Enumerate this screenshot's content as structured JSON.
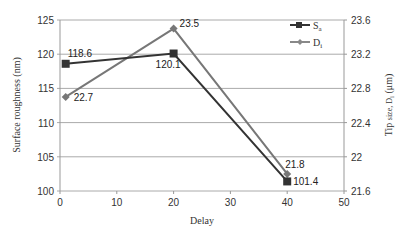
{
  "chart_data": {
    "type": "line",
    "title": "",
    "xlabel": "Delay",
    "ylabel": "Surface roughness (nm)",
    "y2label": "Tip size, D_i (μm)",
    "xlim": [
      0,
      50
    ],
    "ylim": [
      100,
      125
    ],
    "y2lim": [
      21.6,
      23.6
    ],
    "x_ticks": [
      "0",
      "10",
      "20",
      "30",
      "40",
      "50"
    ],
    "y_ticks": [
      "100",
      "105",
      "110",
      "115",
      "120",
      "125"
    ],
    "y2_ticks": [
      "21.6",
      "22",
      "22.4",
      "22.8",
      "23.2",
      "23.6"
    ],
    "grid": true,
    "legend_position": "top-right",
    "x": [
      1,
      20,
      40
    ],
    "series": [
      {
        "name": "Sa",
        "axis": "left",
        "values": [
          118.6,
          120.1,
          101.4
        ],
        "labels": [
          "118.6",
          "120.1",
          "101.4"
        ],
        "marker": "square",
        "color": "#333333"
      },
      {
        "name": "Di",
        "axis": "right",
        "values": [
          22.7,
          23.5,
          21.8
        ],
        "labels": [
          "22.7",
          "23.5",
          "21.8"
        ],
        "marker": "diamond",
        "color": "#777777"
      }
    ]
  },
  "legend": {
    "sa_main": "S",
    "sa_sub": "a",
    "di_main": "D",
    "di_sub": "i"
  },
  "axes": {
    "x_title": "Delay",
    "y_title": "Surface roughness (nm)",
    "y2_title_a": "Tip ",
    "y2_title_b": "size, D",
    "y2_title_sub": "i",
    "y2_title_c": " (μm)"
  }
}
